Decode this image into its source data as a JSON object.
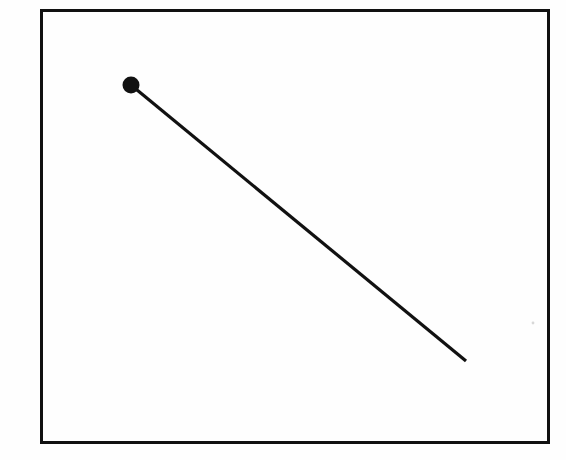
{
  "figure": {
    "title": "",
    "background_color": "#fefefe",
    "ink_color": "#111111",
    "canvas": {
      "width": 566,
      "height": 460
    },
    "caption": ""
  },
  "frame": {
    "name": "plot-frame",
    "x": 41,
    "y": 10,
    "width": 507,
    "height": 432,
    "stroke_width": 3,
    "stroke_color": "#111111",
    "fill": "none"
  },
  "chart_data": {
    "type": "line",
    "title": "",
    "xlabel": "",
    "ylabel": "",
    "grid": false,
    "legend": null,
    "axis_ticks": {
      "x": [],
      "y": []
    },
    "xlim": [
      0,
      1
    ],
    "ylim": [
      0,
      1
    ],
    "series": [
      {
        "name": "descending-segment",
        "color": "#111111",
        "line_width": 3.2,
        "marker": "filled-circle",
        "marker_radius": 8.5,
        "marker_at": "start",
        "points_px": [
          {
            "x": 131,
            "y": 85
          },
          {
            "x": 466,
            "y": 361
          }
        ],
        "points_normalized": [
          {
            "x": 0.178,
            "y": 0.824
          },
          {
            "x": 0.838,
            "y": 0.188
          }
        ],
        "slope_px": -0.824,
        "values": [
          0.824,
          0.188
        ],
        "x": [
          0.178,
          0.838
        ]
      }
    ],
    "annotations": []
  },
  "marker": {
    "name": "data-point-marker",
    "cx": 131,
    "cy": 85,
    "r": 8.5,
    "fill": "#111111"
  },
  "speck": {
    "name": "scan-speck",
    "cx": 533,
    "cy": 323,
    "r": 1.4,
    "fill": "#d8d8d8"
  }
}
